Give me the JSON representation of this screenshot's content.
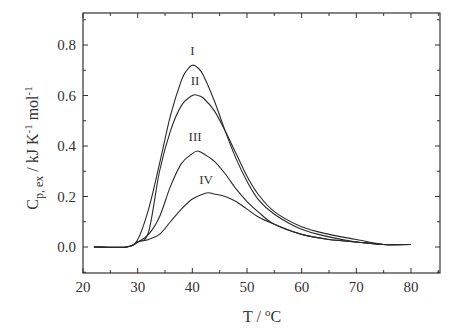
{
  "chart_data": {
    "type": "line",
    "title": "",
    "xlabel": "T / °C",
    "ylabel": "C p, ex / kJ K -1 mol -1",
    "ylabel_parts": {
      "main": "C",
      "sub": "p, ex",
      "rest": " / kJ K",
      "sup1": "-1",
      "rest2": " mol",
      "sup2": "-1"
    },
    "xlabel_parts": {
      "main": "T / ",
      "sup": "o",
      "rest": "C"
    },
    "xlim": [
      20,
      85
    ],
    "ylim": [
      -0.1,
      0.9
    ],
    "xticks": [
      20,
      30,
      40,
      50,
      60,
      70,
      80
    ],
    "xtick_labels": [
      "20",
      "30",
      "40",
      "50",
      "60",
      "70",
      "80"
    ],
    "yticks": [
      0.0,
      0.2,
      0.4,
      0.6,
      0.8
    ],
    "ytick_labels": [
      "0.0",
      "0.2",
      "0.4",
      "0.6",
      "0.8"
    ],
    "grid": false,
    "legend": "none (curves labeled inline)",
    "series": [
      {
        "name": "I",
        "label_pos": [
          40.0,
          0.76
        ],
        "x": [
          22,
          28,
          30,
          32,
          34,
          36,
          38,
          39,
          40,
          41,
          42,
          44,
          46,
          48,
          50,
          52,
          55,
          60,
          65,
          70,
          75,
          80
        ],
        "y": [
          0.0,
          0.0,
          0.03,
          0.15,
          0.33,
          0.52,
          0.66,
          0.7,
          0.72,
          0.71,
          0.68,
          0.58,
          0.46,
          0.35,
          0.26,
          0.19,
          0.13,
          0.07,
          0.04,
          0.02,
          0.01,
          0.01
        ]
      },
      {
        "name": "II",
        "label_pos": [
          40.5,
          0.64
        ],
        "x": [
          22,
          28,
          30,
          32,
          34,
          36,
          38,
          40,
          41,
          42,
          44,
          46,
          48,
          50,
          52,
          55,
          60,
          65,
          70,
          75,
          80
        ],
        "y": [
          0.0,
          0.0,
          0.02,
          0.06,
          0.3,
          0.46,
          0.56,
          0.6,
          0.6,
          0.59,
          0.54,
          0.46,
          0.37,
          0.28,
          0.21,
          0.14,
          0.08,
          0.05,
          0.03,
          0.01,
          0.01
        ]
      },
      {
        "name": "III",
        "label_pos": [
          40.5,
          0.42
        ],
        "x": [
          22,
          28,
          30,
          32,
          34,
          36,
          38,
          40,
          41,
          42,
          44,
          46,
          48,
          50,
          52,
          55,
          60,
          65,
          70,
          75,
          80
        ],
        "y": [
          0.0,
          0.0,
          0.02,
          0.05,
          0.12,
          0.24,
          0.33,
          0.37,
          0.38,
          0.37,
          0.34,
          0.29,
          0.23,
          0.18,
          0.14,
          0.09,
          0.05,
          0.03,
          0.02,
          0.01,
          0.01
        ]
      },
      {
        "name": "IV",
        "label_pos": [
          42.5,
          0.25
        ],
        "x": [
          22,
          28,
          30,
          32,
          34,
          36,
          38,
          40,
          42,
          43,
          44,
          46,
          48,
          50,
          52,
          55,
          60,
          65,
          70,
          75,
          80
        ],
        "y": [
          0.0,
          0.0,
          0.02,
          0.03,
          0.05,
          0.1,
          0.15,
          0.19,
          0.21,
          0.215,
          0.21,
          0.2,
          0.18,
          0.15,
          0.12,
          0.09,
          0.05,
          0.03,
          0.02,
          0.01,
          0.01
        ]
      }
    ]
  },
  "plot_area": {
    "left": 83,
    "right": 440,
    "top": 13,
    "bottom": 273
  },
  "colors": {
    "line": "#2a2a2a",
    "axis": "#333333",
    "background": "#ffffff"
  }
}
